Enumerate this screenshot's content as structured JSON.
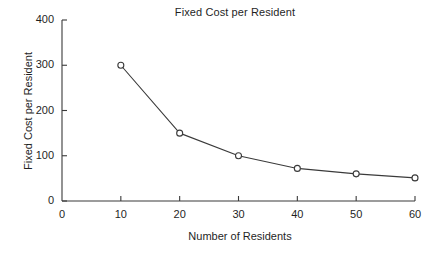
{
  "chart_data": {
    "type": "line",
    "title": "Fixed Cost per Resident",
    "xlabel": "Number of Residents",
    "ylabel": "Fixed Cost per Resident",
    "x": [
      10,
      20,
      30,
      40,
      50,
      60
    ],
    "values": [
      300,
      150,
      100,
      72,
      60,
      51
    ],
    "series": [
      {
        "name": "Fixed Cost per Resident",
        "values": [
          300,
          150,
          100,
          72,
          60,
          51
        ]
      }
    ],
    "xlim": [
      0,
      60
    ],
    "ylim": [
      0,
      400
    ],
    "xticks": [
      0,
      10,
      20,
      30,
      40,
      50,
      60
    ],
    "yticks": [
      0,
      100,
      200,
      300,
      400
    ],
    "xtick_labels": [
      "0",
      "10",
      "20",
      "30",
      "40",
      "50",
      "60"
    ],
    "ytick_labels": [
      "0",
      "100",
      "200",
      "300",
      "400"
    ],
    "grid": false,
    "legend": false,
    "marker": "open-circle",
    "line_color": "#3a3a3a",
    "marker_color": "#3a3a3a",
    "axis_color": "#3a3a3a",
    "background_color": "#ffffff"
  }
}
